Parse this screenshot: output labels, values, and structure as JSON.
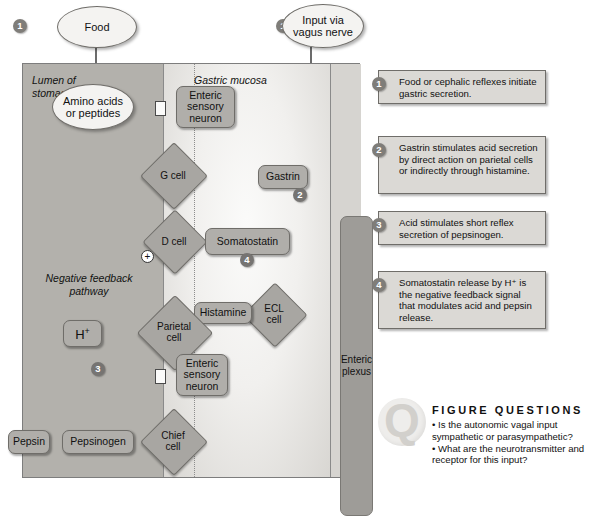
{
  "diagram": {
    "regions": {
      "lumen_label": "Lumen of\nstomach",
      "lumen_label_line1": "Lumen of",
      "lumen_label_line2": "stomach",
      "mucosa_label": "Gastric mucosa",
      "plexus_label_line1": "Enteric",
      "plexus_label_line2": "plexus",
      "feedback_label_line1": "Negative feedback",
      "feedback_label_line2": "pathway"
    },
    "inputs": [
      {
        "name": "food",
        "label": "Food",
        "step": "1"
      },
      {
        "name": "vagus",
        "label_line1": "Input via",
        "label_line2": "vagus nerve",
        "step": "1"
      }
    ],
    "nodes": {
      "amino_acids_line1": "Amino acids",
      "amino_acids_line2": "or peptides",
      "enteric_sensory_neuron_1_line1": "Enteric",
      "enteric_sensory_neuron_1_line2": "sensory",
      "enteric_sensory_neuron_1_line3": "neuron",
      "enteric_sensory_neuron_2_line1": "Enteric",
      "enteric_sensory_neuron_2_line2": "sensory",
      "enteric_sensory_neuron_2_line3": "neuron",
      "g_cell": "G cell",
      "d_cell": "D cell",
      "ecl_cell_line1": "ECL",
      "ecl_cell_line2": "cell",
      "parietal_cell_line1": "Parietal",
      "parietal_cell_line2": "cell",
      "chief_cell_line1": "Chief",
      "chief_cell_line2": "cell",
      "gastrin": "Gastrin",
      "gastrin_step": "2",
      "somatostatin": "Somatostatin",
      "somatostatin_step": "4",
      "histamine": "Histamine",
      "hydrogen_ion": "H",
      "hydrogen_ion_sup": "+",
      "pepsinogen": "Pepsinogen",
      "pepsin": "Pepsin",
      "acid_step": "3",
      "plus_sign": "+"
    }
  },
  "steps": [
    {
      "num": "1",
      "text": "Food or cephalic reflexes initiate gastric secretion."
    },
    {
      "num": "2",
      "text": "Gastrin stimulates acid secretion by direct action on parietal cells or indirectly through histamine."
    },
    {
      "num": "3",
      "text": "Acid stimulates short reflex secretion of pepsinogen."
    },
    {
      "num": "4",
      "text": "Somatostatin release by H⁺ is the negative feedback signal that modulates acid and pepsin release."
    }
  ],
  "figure_questions": {
    "icon": "question-mark",
    "heading": "FIGURE QUESTIONS",
    "q1": "• Is the autonomic vagal input sympathetic or parasympathetic?",
    "q2": "• What are the neurotransmitter and receptor for this input?"
  },
  "colors": {
    "lumen_fill": "#b3b1ac",
    "mucosa_fill": "#f1f0ee",
    "serosa_fill": "#d6d4d0",
    "node_fill": "#b0aeaa",
    "plexus_fill": "#9e9c98",
    "badge_fill": "#7f7d79",
    "stroke": "#6f6d69",
    "callout_fill": "#dbd9d5"
  }
}
